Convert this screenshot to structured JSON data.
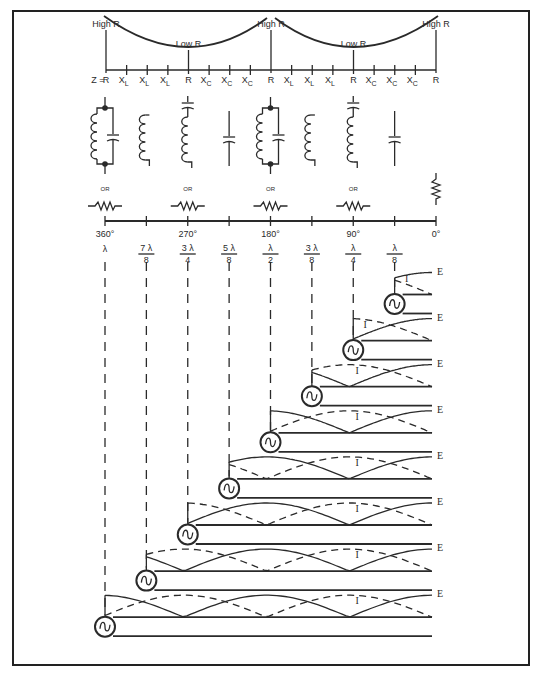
{
  "impedance_scale": {
    "high_r_label": "High R",
    "low_r_label": "Low R",
    "z_prefix": "Z =",
    "tick_labels": [
      "R",
      "XL",
      "XL",
      "XL",
      "R",
      "XC",
      "XC",
      "XC",
      "R",
      "XL",
      "XL",
      "XL",
      "R",
      "XC",
      "XC",
      "XC",
      "R"
    ]
  },
  "equivalents": {
    "or_label": "OR",
    "components": [
      {
        "position": "360",
        "type": "parallel-lc",
        "alt": "resistor"
      },
      {
        "position": "315",
        "type": "inductor"
      },
      {
        "position": "270",
        "type": "series-lc",
        "alt": "resistor"
      },
      {
        "position": "225",
        "type": "capacitor"
      },
      {
        "position": "180",
        "type": "parallel-lc",
        "alt": "resistor"
      },
      {
        "position": "135",
        "type": "inductor"
      },
      {
        "position": "90",
        "type": "series-lc",
        "alt": "resistor"
      },
      {
        "position": "45",
        "type": "capacitor"
      },
      {
        "position": "0",
        "type": "resistor"
      }
    ]
  },
  "length_scale": {
    "degree_labels": [
      "360°",
      "",
      "270°",
      "",
      "180°",
      "",
      "90°",
      "",
      "0°"
    ],
    "wavelength_labels": [
      {
        "num": "λ",
        "den": ""
      },
      {
        "num": "7 λ",
        "den": "8"
      },
      {
        "num": "3 λ",
        "den": "4"
      },
      {
        "num": "5 λ",
        "den": "8"
      },
      {
        "num": "λ",
        "den": "2"
      },
      {
        "num": "3 λ",
        "den": "8"
      },
      {
        "num": "λ",
        "den": "4"
      },
      {
        "num": "λ",
        "den": "8"
      },
      {
        "num": "",
        "den": ""
      }
    ]
  },
  "lines": {
    "voltage_label": "E",
    "current_label": "I",
    "stages": [
      {
        "length": "λ/8"
      },
      {
        "length": "λ/4"
      },
      {
        "length": "3λ/8"
      },
      {
        "length": "λ/2"
      },
      {
        "length": "5λ/8"
      },
      {
        "length": "3λ/4"
      },
      {
        "length": "7λ/8"
      },
      {
        "length": "λ"
      }
    ]
  }
}
